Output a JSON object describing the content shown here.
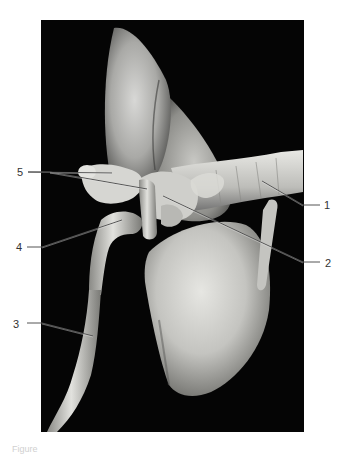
{
  "figure": {
    "type": "anatomical photograph",
    "background_color": "#ffffff",
    "photo_background": "#050505",
    "leader_line_color": "#555555",
    "labels": [
      {
        "id": "1",
        "text": "1",
        "side": "right"
      },
      {
        "id": "2",
        "text": "2",
        "side": "right"
      },
      {
        "id": "3",
        "text": "3",
        "side": "left"
      },
      {
        "id": "4",
        "text": "4",
        "side": "left"
      },
      {
        "id": "5",
        "text": "5",
        "side": "left"
      }
    ],
    "caption": "Figure"
  }
}
